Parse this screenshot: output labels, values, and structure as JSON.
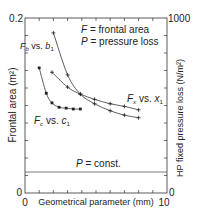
{
  "chart_data": {
    "type": "line",
    "title": "",
    "xlabel": "Geometrical parameter (mm)",
    "ylabel": "Frontal area (m²)",
    "ylabel_right": "HP fixed pressure loss (N/m²)",
    "xlim": [
      0,
      10
    ],
    "ylim": [
      0,
      0.2
    ],
    "ylim_right": [
      0,
      1000
    ],
    "x_ticks": [
      "0",
      "10"
    ],
    "y_ticks": [
      "0",
      "0.2"
    ],
    "y_ticks_right": [
      "0",
      "1000"
    ],
    "grid": false,
    "legend_text": [
      "F = frontal area",
      "P = pressure loss"
    ],
    "series": [
      {
        "name": "Fc vs. c1",
        "label_main": "F",
        "label_sub1": "c",
        "label_mid": " vs. ",
        "label_var": "c",
        "label_sub2": "1",
        "marker": "square",
        "x": [
          1.0,
          1.5,
          1.9,
          2.4,
          2.9,
          3.4,
          3.9
        ],
        "values": [
          0.143,
          0.114,
          0.103,
          0.098,
          0.097,
          0.096,
          0.096
        ]
      },
      {
        "name": "Fb vs. b1",
        "label_main": "F",
        "label_sub1": "b",
        "label_mid": " vs. ",
        "label_var": "b",
        "label_sub2": "1",
        "marker": "plus",
        "x": [
          2.0,
          3.0,
          3.9,
          4.9,
          6.0,
          7.0,
          8.0
        ],
        "values": [
          0.183,
          0.135,
          0.113,
          0.102,
          0.094,
          0.089,
          0.086
        ]
      },
      {
        "name": "Fx vs. x1",
        "label_main": "F",
        "label_sub1": "x",
        "label_mid": " vs. ",
        "label_var": "x",
        "label_sub2": "1",
        "marker": "plus",
        "x": [
          1.9,
          3.0,
          3.9,
          4.9,
          6.0,
          7.0,
          8.0
        ],
        "values": [
          0.138,
          0.121,
          0.113,
          0.107,
          0.102,
          0.099,
          0.095
        ]
      }
    ],
    "annotations": [
      {
        "text": "P = const.",
        "type": "horizontal-line",
        "y_right": 120
      }
    ]
  }
}
